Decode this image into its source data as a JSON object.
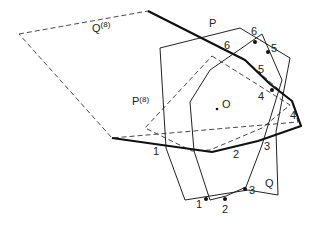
{
  "figure": {
    "polygons": {
      "P": {
        "label": "P",
        "style": "solid-thin",
        "points": [
          [
            160,
            48
          ],
          [
            240,
            28
          ],
          [
            290,
            58
          ],
          [
            276,
            132
          ],
          [
            278,
            195
          ],
          [
            248,
            190
          ],
          [
            185,
            200
          ],
          [
            166,
            148
          ]
        ]
      },
      "Q": {
        "label": "Q",
        "style": "solid-thin",
        "points": [
          [
            262,
            34
          ],
          [
            282,
            80
          ],
          [
            262,
            145
          ],
          [
            246,
            187
          ],
          [
            226,
            196
          ],
          [
            210,
            200
          ],
          [
            194,
            151
          ],
          [
            190,
            102
          ],
          [
            210,
            70
          ]
        ]
      },
      "P8": {
        "label": "P",
        "superscript": "(8)",
        "style": "dashed",
        "points": [
          [
            212,
            56
          ],
          [
            290,
            105
          ],
          [
            262,
            128
          ],
          [
            210,
            150
          ],
          [
            192,
            151
          ],
          [
            145,
            128
          ]
        ]
      },
      "Q8": {
        "label": "Q",
        "superscript": "(8)",
        "style": "dashed",
        "points": [
          [
            19,
            34
          ],
          [
            148,
            11
          ],
          [
            245,
            60
          ],
          [
            292,
            101
          ],
          [
            298,
            122
          ],
          [
            112,
            138
          ]
        ]
      },
      "bold_path": {
        "style": "solid-bold",
        "points": [
          [
            148,
            11
          ],
          [
            245,
            60
          ],
          [
            270,
            84
          ],
          [
            292,
            101
          ],
          [
            301,
            126
          ],
          [
            258,
            141
          ],
          [
            212,
            152
          ],
          [
            112,
            138
          ]
        ]
      }
    },
    "labels": {
      "Q8": {
        "text": "Q",
        "sup": "(8)",
        "x": 92,
        "y": 32
      },
      "P8": {
        "text": "P",
        "sup": "(8)",
        "x": 132,
        "y": 105
      },
      "P": {
        "text": "P",
        "x": 209,
        "y": 27
      },
      "Q": {
        "text": "Q",
        "x": 265,
        "y": 187
      },
      "O": {
        "text": "O",
        "x": 222,
        "y": 108
      }
    },
    "vertex_numbers": [
      {
        "text": "6",
        "x": 251,
        "y": 35
      },
      {
        "text": "5",
        "x": 271,
        "y": 52
      },
      {
        "text": "6",
        "x": 224,
        "y": 49
      },
      {
        "text": "5",
        "x": 258,
        "y": 73
      },
      {
        "text": "4",
        "x": 258,
        "y": 100
      },
      {
        "text": "4",
        "x": 290,
        "y": 119
      },
      {
        "text": "3",
        "x": 264,
        "y": 150
      },
      {
        "text": "2",
        "x": 233,
        "y": 158
      },
      {
        "text": "1",
        "x": 153,
        "y": 155
      },
      {
        "text": "3",
        "x": 249,
        "y": 194
      },
      {
        "text": "2",
        "x": 222,
        "y": 213
      },
      {
        "text": "1",
        "x": 196,
        "y": 208
      }
    ],
    "points": [
      {
        "name": "intersection-6",
        "x": 255,
        "y": 42
      },
      {
        "name": "intersection-5",
        "x": 268,
        "y": 52
      },
      {
        "name": "intersection-4",
        "x": 272,
        "y": 90
      },
      {
        "name": "intersection-3",
        "x": 245,
        "y": 189
      },
      {
        "name": "intersection-2",
        "x": 225,
        "y": 199
      },
      {
        "name": "intersection-1",
        "x": 206,
        "y": 199
      },
      {
        "name": "origin-O",
        "x": 217,
        "y": 109
      }
    ]
  }
}
